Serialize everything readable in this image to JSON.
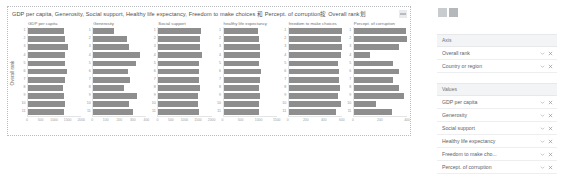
{
  "visual": {
    "title": "GDP per capita,  Generosity,  Social support,  Healthy life expectancy,  Freedom to make choices 和 Percept. of corruption按 Overall rank划",
    "menu_icon": "more-options-icon",
    "y_axis_title": "Overall rank"
  },
  "chart_data": {
    "type": "bar",
    "title": "GDP per capita,  Generosity,  Social support,  Healthy life expectancy,  Freedom to make choices 和 Percept. of corruption按 Overall rank划",
    "orientation": "horizontal",
    "xlabel": "",
    "ylabel": "Overall rank",
    "categories": [
      "1",
      "2",
      "3",
      "4",
      "5",
      "6",
      "7",
      "8",
      "9",
      "10",
      "11"
    ],
    "grid": false,
    "legend": "none",
    "panels": [
      {
        "title": "GDP per capita",
        "xlim": [
          0,
          2000
        ],
        "xticks": [
          "0",
          "500",
          "1000",
          "1500",
          "2000"
        ],
        "values": [
          1340,
          1383,
          1488,
          1380,
          1396,
          1452,
          1387,
          1303,
          1365,
          1376,
          1372
        ]
      },
      {
        "title": "Generosity",
        "xlim": [
          0,
          400
        ],
        "xticks": [
          "0",
          "100",
          "200",
          "300",
          "400"
        ],
        "values": [
          153,
          252,
          271,
          354,
          322,
          263,
          275,
          233,
          332,
          267,
          301
        ]
      },
      {
        "title": "Social support",
        "xlim": [
          0,
          2000
        ],
        "xticks": [
          "0",
          "500",
          "1000",
          "1500",
          "2000"
        ],
        "values": [
          1587,
          1573,
          1582,
          1624,
          1522,
          1526,
          1548,
          1553,
          1505,
          1500,
          1548
        ]
      },
      {
        "title": "healthy life expectancy",
        "xlim": [
          0,
          1500
        ],
        "xticks": [
          "0",
          "500",
          "1000",
          "1500"
        ],
        "values": [
          986,
          996,
          1028,
          1026,
          999,
          1052,
          1036,
          1007,
          1026,
          1008,
          1000
        ]
      },
      {
        "title": "freedom to make choices",
        "xlim": [
          0,
          600
        ],
        "xticks": [
          "0",
          "200",
          "400",
          "600"
        ],
        "values": [
          596,
          592,
          603,
          591,
          557,
          572,
          564,
          576,
          558,
          585,
          532
        ]
      },
      {
        "title": "Percept. of corruption",
        "xlim": [
          0,
          400
        ],
        "xticks": [
          "0",
          "200",
          "400"
        ],
        "values": [
          393,
          410,
          341,
          118,
          298,
          343,
          298,
          343,
          380,
          168,
          286
        ]
      }
    ]
  },
  "pane": {
    "icons": [
      "visualizations-icon",
      "fields-icon"
    ],
    "axis_well": {
      "title": "Axis",
      "fields": [
        {
          "label": "Overall rank"
        },
        {
          "label": "Country or region"
        }
      ]
    },
    "values_well": {
      "title": "Values",
      "fields": [
        {
          "label": "GDP per capita"
        },
        {
          "label": "Generosity"
        },
        {
          "label": "Social support"
        },
        {
          "label": "Healthy life expectancy"
        },
        {
          "label": "Freedom to make cho..."
        },
        {
          "label": "Percept. of corruption"
        }
      ]
    },
    "chevron_icon": "chevron-down-icon",
    "remove_icon": "close-icon"
  },
  "colors": {
    "bar": "#8e8e8e",
    "well_header_bg": "#f3f4f5",
    "text": "#5d6369"
  }
}
